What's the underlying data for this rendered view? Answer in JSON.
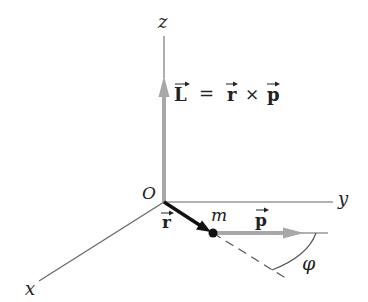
{
  "diagram": {
    "axes": {
      "z_label": "z",
      "y_label": "y",
      "x_label": "x",
      "origin_label": "O"
    },
    "vectors": {
      "L_symbol": "L",
      "r_symbol": "r",
      "p_symbol": "p",
      "equation": {
        "lhs": "L",
        "equals": "=",
        "term1": "r",
        "times": "×",
        "term2": "p"
      }
    },
    "particle_label": "m",
    "angle_label": "φ",
    "colors": {
      "axis": "#555555",
      "L_vector": "#a8a8a8",
      "p_vector": "#a8a8a8",
      "r_vector": "#111111",
      "text": "#222222"
    }
  }
}
